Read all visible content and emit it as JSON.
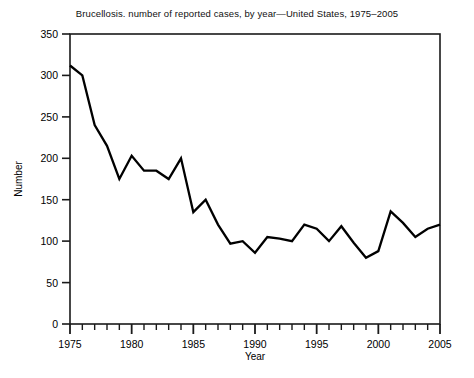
{
  "chart_data": {
    "type": "line",
    "title": "Brucellosis. number of reported cases, by year—United States, 1975–2005",
    "xlabel": "Year",
    "ylabel": "Number",
    "xlim": [
      1975,
      2005
    ],
    "ylim": [
      0,
      350
    ],
    "yticks": [
      0,
      50,
      100,
      150,
      200,
      250,
      300,
      350
    ],
    "xticks_major": [
      1975,
      1980,
      1985,
      1990,
      1995,
      2000,
      2005
    ],
    "xtick_minor_step": 1,
    "grid": false,
    "legend": "none",
    "line_color": "#000000",
    "x": [
      1975,
      1976,
      1977,
      1978,
      1979,
      1980,
      1981,
      1982,
      1983,
      1984,
      1985,
      1986,
      1987,
      1988,
      1989,
      1990,
      1991,
      1992,
      1993,
      1994,
      1995,
      1996,
      1997,
      1998,
      1999,
      2000,
      2001,
      2002,
      2003,
      2004,
      2005
    ],
    "values": [
      312,
      300,
      240,
      215,
      175,
      203,
      185,
      185,
      175,
      200,
      135,
      150,
      120,
      97,
      100,
      86,
      105,
      103,
      100,
      120,
      115,
      100,
      118,
      98,
      80,
      88,
      136,
      122,
      105,
      115,
      120
    ]
  },
  "ytick_labels": [
    "350",
    "300",
    "250",
    "200",
    "150",
    "100",
    "50",
    "0"
  ],
  "xtick_labels": [
    "1975",
    "1980",
    "1985",
    "1990",
    "1995",
    "2000",
    "2005"
  ]
}
